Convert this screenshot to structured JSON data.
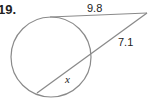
{
  "problem": {
    "number": "19."
  },
  "diagram": {
    "stroke_color": "#8a8a8a",
    "circle": {
      "cx": 51,
      "cy": 57,
      "r": 40
    },
    "external_point": {
      "x": 147,
      "y": 13
    },
    "tangent": {
      "from": {
        "x": 50,
        "y": 17
      },
      "to": {
        "x": 147,
        "y": 13
      },
      "label": "9.8"
    },
    "secant": {
      "far_point": {
        "x": 37,
        "y": 93
      },
      "near_point": {
        "x": 91,
        "y": 56
      },
      "to": {
        "x": 147,
        "y": 13
      },
      "external_label": "7.1",
      "internal_label": "x"
    }
  }
}
